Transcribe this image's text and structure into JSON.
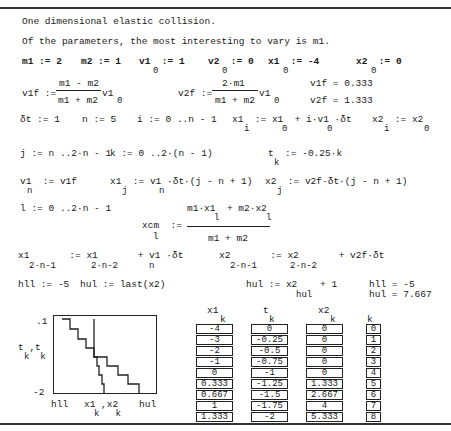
{
  "document": {
    "title": "One dimensional elastic collision.",
    "intro": "Of the parameters, the most interesting to vary is m1."
  },
  "params": {
    "m1": "m1 := 2",
    "m2": "m2 := 1",
    "v1_0": "v1  := 1",
    "v2_0": "v2  := 0",
    "x1_0": "x1  := -4",
    "x2_0": "x2  := 0",
    "sub0": "0"
  },
  "velocities": {
    "v1f_lhs": "v1f :=",
    "v1f_num": "m1 - m2",
    "v1f_den": "m1 + m2",
    "v1f_tail": "v1",
    "v2f_lhs": "v2f :=",
    "v2f_num": "2·m1",
    "v2f_den": "m1 + m2",
    "v2f_tail": "v1",
    "v1f_result": "v1f = 0.333",
    "v2f_result": "v2f = 1.333"
  },
  "row_dt": {
    "dt": "δt := 1",
    "n": "n := 5",
    "i_range": "i := 0 ..n - 1",
    "x1i": "x1  := x1  + i·v1 ·δt",
    "x2i": "x2  := x2",
    "sub_i": "i",
    "sub_0": "0"
  },
  "row_j": {
    "j_range": "j := n ..2·n - 1",
    "k_range": "k := 0 ..2·(n - 1)",
    "tk": "t  := -0.25·k",
    "sub_k": "k"
  },
  "row_v1n": {
    "v1n": "v1  := v1f",
    "x1j": "x1  := v1 ·δt·(j - n + 1)",
    "x2j": "x2  := v2f·δt·(j - n + 1)",
    "sub_n": "n",
    "sub_j": "j"
  },
  "row_l": {
    "l_range": "l := 0 ..2·n - 1",
    "xcm_lhs": "xcm  :=",
    "xcm_num": "m1·x1  + m2·x2",
    "xcm_den": "m1 + m2",
    "sub_l": "l"
  },
  "row_last": {
    "x1_last": "x1       := x1       + v1 ·δt",
    "x2_last": "x2       := x2       + v2f·δt",
    "sub_2n1": "2·n-1",
    "sub_2n2": "2·n-2",
    "sub_n": "n"
  },
  "row_h": {
    "hll_def": "hll := -5",
    "hul_def": "hul := last(x2)",
    "hul_redef": "hul := x2    + 1",
    "sub_hul": "hul",
    "hll_result": "hll = -5",
    "hul_result": "hul = 7.667"
  },
  "chart_data": {
    "type": "line",
    "title": "",
    "xlabel": "x1_k, x2_k",
    "ylabel": "t_k, t_k",
    "x_tick_labels": [
      "hll",
      "hul"
    ],
    "y_tick_labels": [
      ".1",
      "-2"
    ],
    "xlim": [
      -5,
      7.667
    ],
    "ylim": [
      -2,
      0.1
    ],
    "grid": false,
    "series": [
      {
        "name": "x1_k vs t_k",
        "x": [
          -4,
          -3,
          -2,
          -1,
          0,
          0.333,
          0.667,
          1,
          1.333
        ],
        "y": [
          0,
          -0.25,
          -0.5,
          -0.75,
          -1,
          -1.25,
          -1.5,
          -1.75,
          -2
        ]
      },
      {
        "name": "x2_k vs t_k",
        "x": [
          0,
          0,
          0,
          0,
          0,
          1.333,
          2.667,
          4,
          5.333
        ],
        "y": [
          0,
          -0.25,
          -0.5,
          -0.75,
          -1,
          -1.25,
          -1.5,
          -1.75,
          -2
        ]
      }
    ]
  },
  "plot_labels": {
    "y_top": ".1",
    "y_bottom": "-2",
    "y_axis": "t ,t",
    "y_axis_sub": "k  k",
    "x_left": "hll",
    "x_right": "hul",
    "x_axis": "x1 ,x2",
    "x_axis_sub": "k   k"
  },
  "tables": {
    "x1": {
      "header": "x1",
      "sub": "k",
      "values": [
        "-4",
        "-3",
        "-2",
        "-1",
        "0",
        "0.333",
        "0.667",
        "1",
        "1.333"
      ]
    },
    "t": {
      "header": "t",
      "sub": "k",
      "values": [
        "0",
        "-0.25",
        "-0.5",
        "-0.75",
        "-1",
        "-1.25",
        "-1.5",
        "-1.75",
        "-2"
      ]
    },
    "x2": {
      "header": "x2",
      "sub": "k",
      "values": [
        "0",
        "0",
        "0",
        "0",
        "0",
        "1.333",
        "2.667",
        "4",
        "5.333"
      ]
    },
    "k": {
      "header": "k",
      "values": [
        "0",
        "1",
        "2",
        "3",
        "4",
        "5",
        "6",
        "7",
        "8"
      ]
    }
  }
}
